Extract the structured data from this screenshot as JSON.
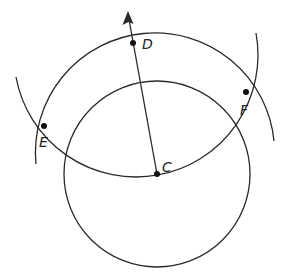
{
  "diagram": {
    "type": "geometric-construction",
    "stroke_color": "#2a2a2a",
    "point_color": "#111111",
    "points": [
      {
        "label": "D",
        "x": 133,
        "y": 43
      },
      {
        "label": "C",
        "x": 157,
        "y": 174
      },
      {
        "label": "E",
        "x": 44,
        "y": 126
      },
      {
        "label": "F",
        "x": 246,
        "y": 92
      }
    ],
    "circles": [
      {
        "name": "circle-centered-C",
        "center": "C",
        "r": 93,
        "full": true
      }
    ],
    "arcs": [
      {
        "name": "arc-centered-C",
        "center": "C",
        "r": 118,
        "through": [
          "E",
          "F"
        ]
      },
      {
        "name": "arc-centered-D",
        "center": "D",
        "r": 121,
        "through": [
          "E",
          "F"
        ]
      }
    ],
    "rays": [
      {
        "name": "ray-CD",
        "from": "C",
        "through": "D",
        "arrow_tip": {
          "x": 128,
          "y": 12
        }
      }
    ]
  },
  "labels": {
    "D": "D",
    "C": "C",
    "E": "E",
    "F": "F"
  }
}
